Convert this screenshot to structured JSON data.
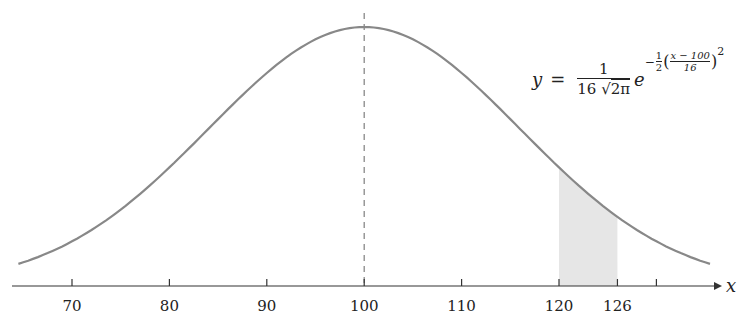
{
  "chart_data": {
    "type": "line",
    "title": "",
    "xlabel": "x",
    "ylabel": "",
    "distribution": "normal",
    "mean": 100,
    "std": 16,
    "equation": "y = 1/(16√(2π)) e^(-1/2((x-100)/16)^2)",
    "x_range": [
      64.5,
      135.5
    ],
    "x_ticks": [
      70,
      80,
      90,
      100,
      110,
      120,
      126,
      130
    ],
    "x_tick_labels": [
      "70",
      "80",
      "90",
      "100",
      "110",
      "120",
      "126",
      ""
    ],
    "shaded_region": {
      "from": 120,
      "to": 126,
      "color": "#e6e6e6"
    },
    "mean_line": {
      "x": 100,
      "style": "dashed"
    },
    "curve_color": "#888888",
    "grid": false,
    "legend": null
  },
  "formula": {
    "lhs": "y",
    "eq": "=",
    "coef_num": "1",
    "coef_den_a": "16",
    "coef_den_b": "2π",
    "base": "e",
    "exp_sign": "−",
    "exp_half_num": "1",
    "exp_half_den": "2",
    "exp_inner_num": "x − 100",
    "exp_inner_den": "16",
    "exp_power": "2"
  },
  "axis": {
    "label": "x",
    "ticks": [
      "70",
      "80",
      "90",
      "100",
      "110",
      "120",
      "126"
    ]
  }
}
